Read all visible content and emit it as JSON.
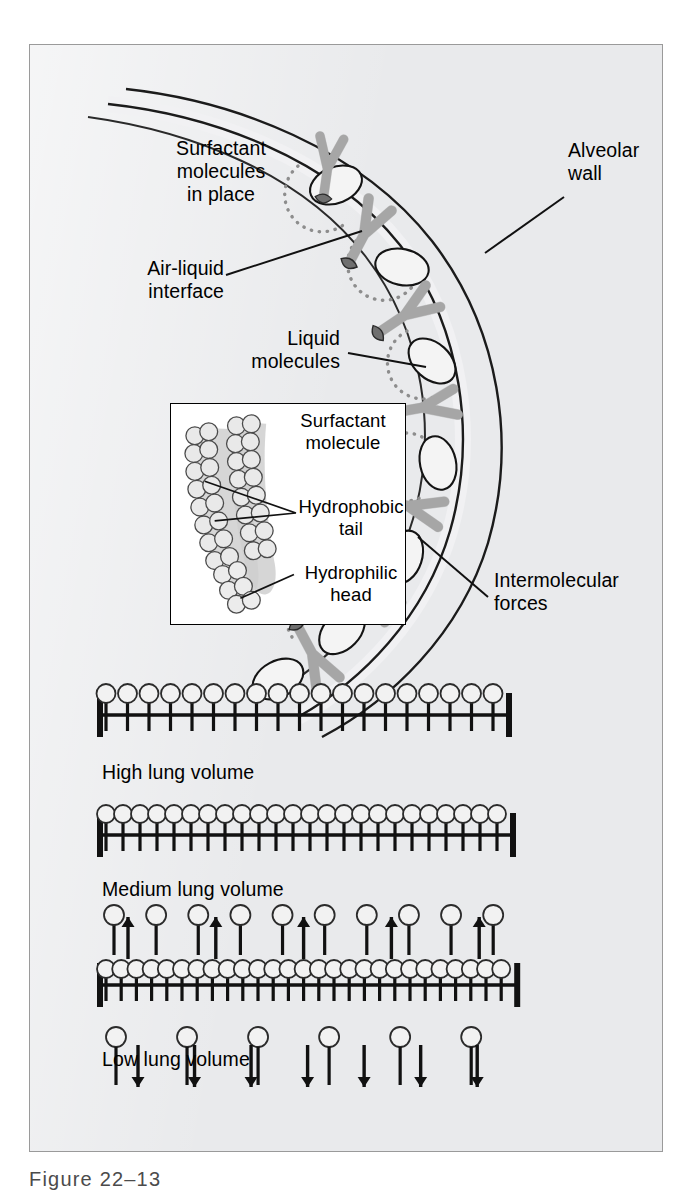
{
  "figure": {
    "caption": "Figure 22–13",
    "background_color": "#e9eaec",
    "border_color": "#9a9a9a"
  },
  "labels": {
    "surfactant_in_place": "Surfactant\nmolecules\nin place",
    "alveolar_wall": "Alveolar\nwall",
    "air_liquid_interface": "Air-liquid\ninterface",
    "liquid_molecules": "Liquid\nmolecules",
    "intermolecular_forces": "Intermolecular\nforces"
  },
  "inset": {
    "title": "Surfactant\nmolecule",
    "hydrophobic_tail": "Hydrophobic\ntail",
    "hydrophilic_head": "Hydrophilic\nhead",
    "head_color": "#e4e4e4",
    "tail_color": "#b9b9b9"
  },
  "volume_rows": [
    {
      "name": "high-lung-volume",
      "label": "High lung volume",
      "molecule_count": 19,
      "spacing": 21.5,
      "packing": "spread",
      "extra_above": 0,
      "extra_below": 0
    },
    {
      "name": "medium-lung-volume",
      "label": "Medium lung volume",
      "molecule_count": 24,
      "spacing": 17.0,
      "packing": "touching",
      "extra_above": 0,
      "extra_below": 0
    },
    {
      "name": "low-lung-volume",
      "label": "Low lung volume",
      "molecule_count": 27,
      "spacing": 15.2,
      "packing": "compressed",
      "extra_above": 10,
      "extra_below": 6,
      "up_arrows": 5,
      "down_arrows": 7
    }
  ],
  "colors": {
    "liquid_fill": "#f2f2f2",
    "liquid_stroke": "#1a1a1a",
    "surfactant_body": "#b5b5b5",
    "surfactant_head": "#8c8c8c",
    "dotted_arc": "#8f8f8f",
    "line": "#111111"
  }
}
